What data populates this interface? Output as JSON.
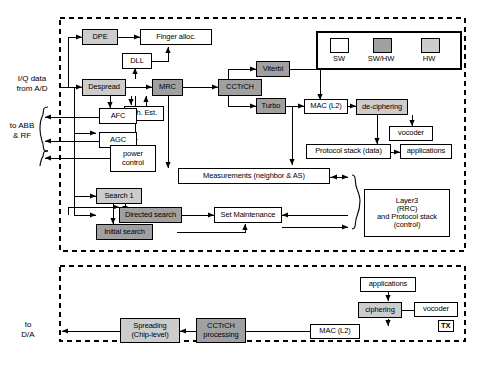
{
  "diagram": {
    "sections": [
      {
        "id": "rx",
        "label": "RX"
      },
      {
        "id": "tx",
        "label": "TX"
      }
    ],
    "legend": {
      "items": [
        {
          "key": "sw",
          "label": "SW",
          "color": "#ffffff"
        },
        {
          "key": "swhw",
          "label": "SW/HW",
          "color": "#a0a0a0"
        },
        {
          "key": "hw",
          "label": "HW",
          "color": "#cccccc"
        }
      ]
    },
    "edge_labels": [
      {
        "id": "iq",
        "text": "I/Q data\nfrom A/D",
        "line1": "I/Q data",
        "line2": "from A/D"
      },
      {
        "id": "abb",
        "text": "to ABB\n& RF",
        "line1": "to ABB",
        "line2": "& RF"
      },
      {
        "id": "da",
        "text": "to\nD/A",
        "line1": "to",
        "line2": "D/A"
      }
    ],
    "blocks": [
      {
        "id": "dpe",
        "label": "DPE",
        "type": "hw"
      },
      {
        "id": "finger_alloc",
        "label": "Finger alloc.",
        "type": "sw"
      },
      {
        "id": "dll",
        "label": "DLL",
        "type": "sw"
      },
      {
        "id": "despread",
        "label": "Despread",
        "type": "hw"
      },
      {
        "id": "mrc",
        "label": "MRC",
        "type": "swhw"
      },
      {
        "id": "ch_est",
        "label": "Ch. Est.",
        "type": "sw"
      },
      {
        "id": "afc",
        "label": "AFC",
        "type": "sw"
      },
      {
        "id": "agc",
        "label": "AGC",
        "type": "sw"
      },
      {
        "id": "power_control",
        "label": "power\ncontrol",
        "line1": "power",
        "line2": "control",
        "type": "sw"
      },
      {
        "id": "cctrch_rx",
        "label": "CCTrCH",
        "type": "swhw"
      },
      {
        "id": "viterbi",
        "label": "Viterbi",
        "type": "swhw"
      },
      {
        "id": "turbo",
        "label": "Turbo",
        "type": "swhw"
      },
      {
        "id": "mac_l2_rx",
        "label": "MAC (L2)",
        "type": "sw"
      },
      {
        "id": "deciphering",
        "label": "de-ciphering",
        "type": "hw"
      },
      {
        "id": "vocoder_rx",
        "label": "vocoder",
        "type": "sw"
      },
      {
        "id": "protocol_stack_data",
        "label": "Protocol stack (data)",
        "type": "sw"
      },
      {
        "id": "applications_rx",
        "label": "applications",
        "type": "sw"
      },
      {
        "id": "measurements",
        "label": "Measurements (neighbor & AS)",
        "type": "sw"
      },
      {
        "id": "search1",
        "label": "Search 1",
        "type": "hw"
      },
      {
        "id": "directed_search",
        "label": "Directed search",
        "type": "swhw"
      },
      {
        "id": "initial_search",
        "label": "Initial search",
        "type": "swhw"
      },
      {
        "id": "set_maintenance",
        "label": "Set Maintenance",
        "type": "sw"
      },
      {
        "id": "layer3",
        "label": "Layer3 (RRC) and Protocol stack (control)",
        "line1": "Layer3",
        "line2": "(RRC)",
        "line3": "and Protocol stack",
        "line4": "(control)",
        "type": "sw"
      },
      {
        "id": "applications_tx",
        "label": "applications",
        "type": "sw"
      },
      {
        "id": "ciphering",
        "label": "ciphering",
        "type": "hw"
      },
      {
        "id": "vocoder_tx",
        "label": "vocoder",
        "type": "sw"
      },
      {
        "id": "mac_l2_tx",
        "label": "MAC (L2)",
        "type": "sw"
      },
      {
        "id": "cctrch_tx",
        "label": "CCTrCH processing",
        "line1": "CCTrCH",
        "line2": "processing",
        "type": "swhw"
      },
      {
        "id": "spreading",
        "label": "Spreading (Chip-level)",
        "line1": "Spreading",
        "line2": "(Chip-level)",
        "type": "hw"
      }
    ]
  }
}
